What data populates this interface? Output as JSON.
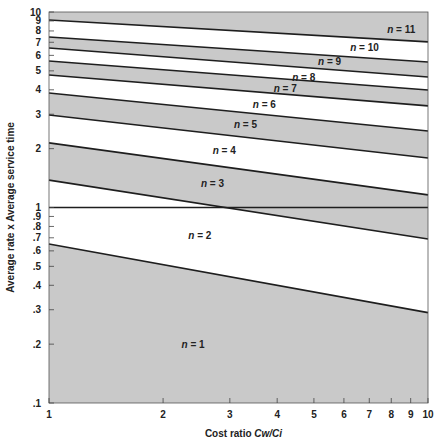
{
  "chart_data": {
    "type": "area",
    "title": "",
    "xlabel": "Cost ratio Cw/Ci",
    "ylabel": "Average rate x Average service time",
    "xscale": "log",
    "yscale": "log",
    "xlim": [
      1,
      10
    ],
    "ylim": [
      0.1,
      10
    ],
    "grid": false,
    "legend": "none",
    "x_ticks": [
      "1",
      "2",
      "3",
      "4",
      "5",
      "6",
      "7",
      "8",
      "9",
      "10"
    ],
    "x_tick_values": [
      1,
      2,
      3,
      4,
      5,
      6,
      7,
      8,
      9,
      10
    ],
    "y_ticks": [
      ".1",
      ".2",
      ".3",
      ".4",
      ".5",
      ".6",
      ".7",
      ".8",
      ".9",
      "1",
      "2",
      "3",
      "4",
      "5",
      "6",
      "7",
      "8",
      "9",
      "10"
    ],
    "y_tick_values": [
      0.1,
      0.2,
      0.3,
      0.4,
      0.5,
      0.6,
      0.7,
      0.8,
      0.9,
      1,
      2,
      3,
      4,
      5,
      6,
      7,
      8,
      9,
      10
    ],
    "reference_line": {
      "y": 1,
      "description": "horizontal line at 1"
    },
    "boundaries": [
      {
        "name": "n=1 / n=2",
        "x": [
          1,
          10
        ],
        "y": [
          0.65,
          0.29
        ]
      },
      {
        "name": "n=2 / n=3",
        "x": [
          1,
          10
        ],
        "y": [
          1.38,
          0.69
        ]
      },
      {
        "name": "n=3 / n=4",
        "x": [
          1,
          10
        ],
        "y": [
          2.14,
          1.16
        ]
      },
      {
        "name": "n=4 / n=5",
        "x": [
          1,
          10
        ],
        "y": [
          2.97,
          1.79
        ]
      },
      {
        "name": "n=5 / n=6",
        "x": [
          1,
          10
        ],
        "y": [
          3.85,
          2.46
        ]
      },
      {
        "name": "n=6 / n=7",
        "x": [
          1,
          10
        ],
        "y": [
          4.76,
          3.31
        ]
      },
      {
        "name": "n=7 / n=8",
        "x": [
          1,
          10
        ],
        "y": [
          5.62,
          3.99
        ]
      },
      {
        "name": "n=8 / n=9",
        "x": [
          1,
          10
        ],
        "y": [
          6.55,
          4.65
        ]
      },
      {
        "name": "n=9 / n=10",
        "x": [
          1,
          10
        ],
        "y": [
          7.45,
          5.55
        ]
      },
      {
        "name": "n=10 / n=11",
        "x": [
          1,
          10
        ],
        "y": [
          9.1,
          7.03
        ]
      }
    ],
    "regions": [
      {
        "label": "n = 1",
        "shaded": true,
        "label_pos": [
          2.4,
          0.2
        ]
      },
      {
        "label": "n = 2",
        "shaded": false,
        "label_pos": [
          2.5,
          0.72
        ]
      },
      {
        "label": "n = 3",
        "shaded": true,
        "label_pos": [
          2.7,
          1.32
        ]
      },
      {
        "label": "n = 4",
        "shaded": false,
        "label_pos": [
          2.9,
          1.95
        ]
      },
      {
        "label": "n = 5",
        "shaded": true,
        "label_pos": [
          3.3,
          2.65
        ]
      },
      {
        "label": "n = 6",
        "shaded": false,
        "label_pos": [
          3.7,
          3.35
        ]
      },
      {
        "label": "n = 7",
        "shaded": true,
        "label_pos": [
          4.2,
          4.05
        ]
      },
      {
        "label": "n = 8",
        "shaded": false,
        "label_pos": [
          4.7,
          4.6
        ]
      },
      {
        "label": "n = 9",
        "shaded": true,
        "label_pos": [
          5.5,
          5.55
        ]
      },
      {
        "label": "n = 10",
        "shaded": false,
        "label_pos": [
          6.8,
          6.6
        ]
      },
      {
        "label": "n = 11",
        "shaded": true,
        "label_pos": [
          8.5,
          8.1
        ]
      }
    ]
  },
  "colors": {
    "shade": "#c9c9c9",
    "line": "#1e1e1e",
    "background": "#ffffff"
  }
}
